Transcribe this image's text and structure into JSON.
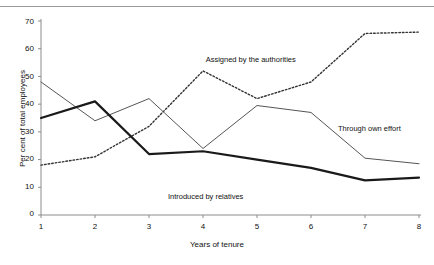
{
  "chart_data": {
    "type": "line",
    "title": "",
    "subtitle": "",
    "xlabel": "Years of tenure",
    "ylabel": "Per cent of total employees",
    "x": [
      1,
      2,
      3,
      4,
      5,
      6,
      7,
      8
    ],
    "xticklabels": [
      "1",
      "2",
      "3",
      "4",
      "5",
      "6",
      "7",
      "8"
    ],
    "yticklabels": [
      "0",
      "10",
      "20",
      "30",
      "40",
      "50",
      "60",
      "70"
    ],
    "yticks": [
      0,
      10,
      20,
      30,
      40,
      50,
      60,
      70
    ],
    "xlim": [
      1,
      8
    ],
    "ylim": [
      0,
      70
    ],
    "grid": false,
    "legend": "inline-annotations",
    "series": [
      {
        "name": "Assigned by the authorities",
        "style": "dotted",
        "color": "#333333",
        "values": [
          18,
          21,
          32,
          52,
          42,
          48,
          65.5,
          66
        ],
        "annotation": {
          "label": "Assigned by the authorities",
          "x": 4.05,
          "y": 56
        }
      },
      {
        "name": "Through own effort",
        "style": "thin-solid",
        "color": "#555555",
        "values": [
          48,
          34,
          42,
          24,
          39.5,
          37,
          20.5,
          18.5
        ],
        "annotation": {
          "label": "Through own effort",
          "x": 6.5,
          "y": 31
        }
      },
      {
        "name": "Introduced by relatives",
        "style": "thick-solid",
        "color": "#1a1a1a",
        "values": [
          35,
          41,
          22,
          23,
          20,
          17,
          12.5,
          13.5
        ],
        "annotation": {
          "label": "Introduced by relatives",
          "x": 3.35,
          "y": 6.5
        }
      }
    ]
  },
  "axes": {
    "y_title": "Per cent of total employees",
    "x_title": "Years of tenure",
    "y_ticks": [
      "70",
      "60",
      "50",
      "40",
      "30",
      "20",
      "10",
      "0"
    ],
    "x_ticks": [
      "1",
      "2",
      "3",
      "4",
      "5",
      "6",
      "7",
      "8"
    ]
  },
  "annotations": {
    "assigned": "Assigned by the authorities",
    "own_effort": "Through own effort",
    "relatives": "Introduced by relatives"
  },
  "colors": {
    "axis": "#8c8c8c",
    "text": "#111111",
    "series_dotted": "#333333",
    "series_thin": "#555555",
    "series_thick": "#1a1a1a",
    "top_rule": "#9a9a9a"
  }
}
